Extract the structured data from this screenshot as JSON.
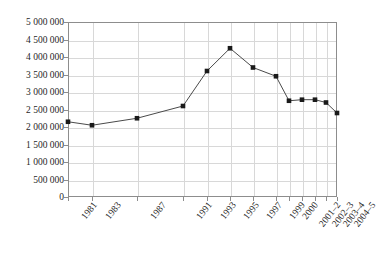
{
  "chart_data": {
    "type": "line",
    "title": "",
    "xlabel": "",
    "ylabel": "",
    "ylim": [
      0,
      5000000
    ],
    "grid": true,
    "legend": "none",
    "categories": [
      "1981",
      "1983",
      "1987",
      "1991",
      "1993",
      "1995",
      "1997",
      "1999",
      "2000",
      "2001–2",
      "2002–3",
      "2003–4",
      "2004–5"
    ],
    "values": [
      2150000,
      2050000,
      2250000,
      2600000,
      3600000,
      4250000,
      3700000,
      3450000,
      2750000,
      2780000,
      2780000,
      2700000,
      2400000
    ],
    "ytick_labels": [
      "0",
      "500 000",
      "1 000 000",
      "1 500 000",
      "2 000 000",
      "2 500 000",
      "3 000 000",
      "3 500 000",
      "4 000 000",
      "4 500 000",
      "5 000 000"
    ],
    "ytick_values": [
      0,
      500000,
      1000000,
      1500000,
      2000000,
      2500000,
      3000000,
      3500000,
      4000000,
      4500000,
      5000000
    ],
    "marker_style": "square",
    "marker_color": "#1a1a1a",
    "line_color": "#4a4a4a",
    "grid_color": "#d8d8d8",
    "axis_color": "#8d8d8d"
  }
}
